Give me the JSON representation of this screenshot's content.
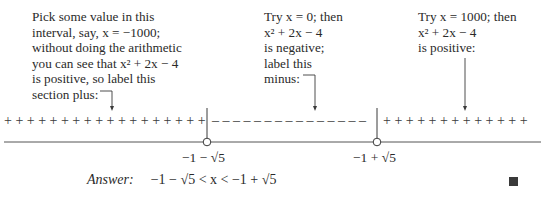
{
  "annotations": {
    "left": {
      "lines": [
        "Pick some value in this",
        "interval, say, x = −1000;",
        "without doing the arithmetic",
        "you can see that x² + 2x − 4",
        "is positive, so label this",
        "section plus:"
      ]
    },
    "middle": {
      "lines": [
        "Try x = 0; then",
        "x² + 2x − 4",
        "is negative;",
        "label this",
        "minus:"
      ]
    },
    "right": {
      "lines": [
        "Try x = 1000; then",
        "x² + 2x − 4",
        "is positive:"
      ]
    }
  },
  "number_line": {
    "left_section_signs": "+ + + + + + + + + + + + + + + + + +",
    "middle_section_signs": "– – – – – – – – – – – – – – –",
    "right_section_signs": "+ + + + + + + + + + + + +",
    "root_left_label": "−1 − √5",
    "root_right_label": "−1 + √5",
    "roots": [
      -3.236,
      1.236
    ],
    "root_markers": "open-circle"
  },
  "answer": {
    "label": "Answer:",
    "expression": "−1 − √5 < x < −1 + √5"
  },
  "end_mark": "qed-square"
}
